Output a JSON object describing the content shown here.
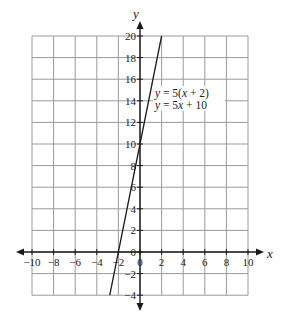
{
  "chart_data": {
    "type": "line",
    "title": "",
    "xlabel": "x",
    "ylabel": "y",
    "xlim": [
      -10,
      10
    ],
    "ylim": [
      -4,
      20
    ],
    "grid": true,
    "x_ticks": [
      -10,
      -8,
      -6,
      -4,
      -2,
      0,
      2,
      4,
      6,
      8,
      10
    ],
    "y_ticks": [
      -4,
      -2,
      0,
      2,
      4,
      6,
      8,
      10,
      12,
      14,
      16,
      18,
      20
    ],
    "x_tick_labels": [
      "−10",
      "−8",
      "−6",
      "−4",
      "−2",
      "0",
      "2",
      "4",
      "6",
      "8",
      "10"
    ],
    "y_tick_labels": [
      "−4",
      "−2",
      "0",
      "2",
      "4",
      "6",
      "8",
      "10",
      "12",
      "14",
      "16",
      "18",
      "20"
    ],
    "series": [
      {
        "name": "y = 5(x + 2)",
        "equation_forms": [
          "y = 5(x + 2)",
          "y = 5x + 10"
        ],
        "slope": 5,
        "intercept": 10,
        "x": [
          -2.8,
          -2,
          0,
          2
        ],
        "y": [
          -4,
          0,
          10,
          20
        ]
      }
    ],
    "annotations": [
      {
        "text": "y = 5(x + 2)",
        "x": 3.0,
        "y": 15
      },
      {
        "text": "y = 5x + 10",
        "x": 3.0,
        "y": 14
      }
    ]
  },
  "labels": {
    "x_axis": "x",
    "y_axis": "y",
    "eq1": {
      "y": "y",
      "mid": " = 5(",
      "x": "x",
      "end": " + 2)"
    },
    "eq2": {
      "y": "y",
      "mid": " = 5",
      "x": "x",
      "end": " + 10"
    }
  }
}
